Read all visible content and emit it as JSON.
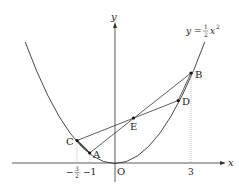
{
  "figure": {
    "curve_label": {
      "lhs": "y",
      "eq": "=",
      "num": "1",
      "den": "2",
      "var": "x",
      "exp": "2"
    },
    "axes": {
      "x_label": "x",
      "y_label": "y",
      "origin_label": "O"
    },
    "ticks": {
      "neg_three_halves": {
        "sign": "−",
        "num": "3",
        "den": "2"
      },
      "neg_one": "−1",
      "three": "3"
    },
    "points": {
      "A": "A",
      "B": "B",
      "C": "C",
      "D": "D",
      "E": "E"
    },
    "colors": {
      "line": "#333333",
      "guide": "#999999"
    }
  }
}
